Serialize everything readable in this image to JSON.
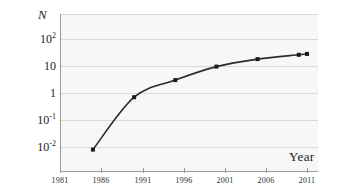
{
  "chart_data": {
    "type": "line",
    "title": "",
    "xlabel": "Year",
    "ylabel": "N",
    "yscale": "log",
    "ylim": [
      0.0033,
      330
    ],
    "xlim": [
      1981,
      2012.5
    ],
    "grid": true,
    "legend": null,
    "x": [
      1985,
      1990,
      1995,
      2000,
      2005,
      2010,
      2011
    ],
    "values": [
      0.008,
      0.7,
      3.0,
      9.5,
      18,
      26,
      28
    ],
    "series": [
      {
        "name": "N",
        "x": [
          1985,
          1990,
          1995,
          2000,
          2005,
          2010,
          2011
        ],
        "values": [
          0.008,
          0.7,
          3.0,
          9.5,
          18,
          26,
          28
        ]
      }
    ],
    "xticks": [
      1981,
      1986,
      1991,
      1996,
      2001,
      2006,
      2011
    ],
    "xticklabels": [
      "1981",
      "1986",
      "1991",
      "1996",
      "2001",
      "2006",
      "2011"
    ],
    "yticks": [
      100,
      10,
      1,
      0.1,
      0.01
    ],
    "yticklabels": [
      "10",
      "10",
      "1",
      "10",
      "10"
    ],
    "ytick_exponents": [
      "2",
      "",
      "",
      "-1",
      "-2"
    ],
    "marker": "square",
    "marker_color": "#1a1a1a",
    "line_color": "#2b2b2b",
    "plot_background": "#f7f7f7",
    "gridline_color": "#d9d9d9",
    "axis_color": "#9a9a9a"
  },
  "axis_titles": {
    "y": "N",
    "x": "Year"
  }
}
